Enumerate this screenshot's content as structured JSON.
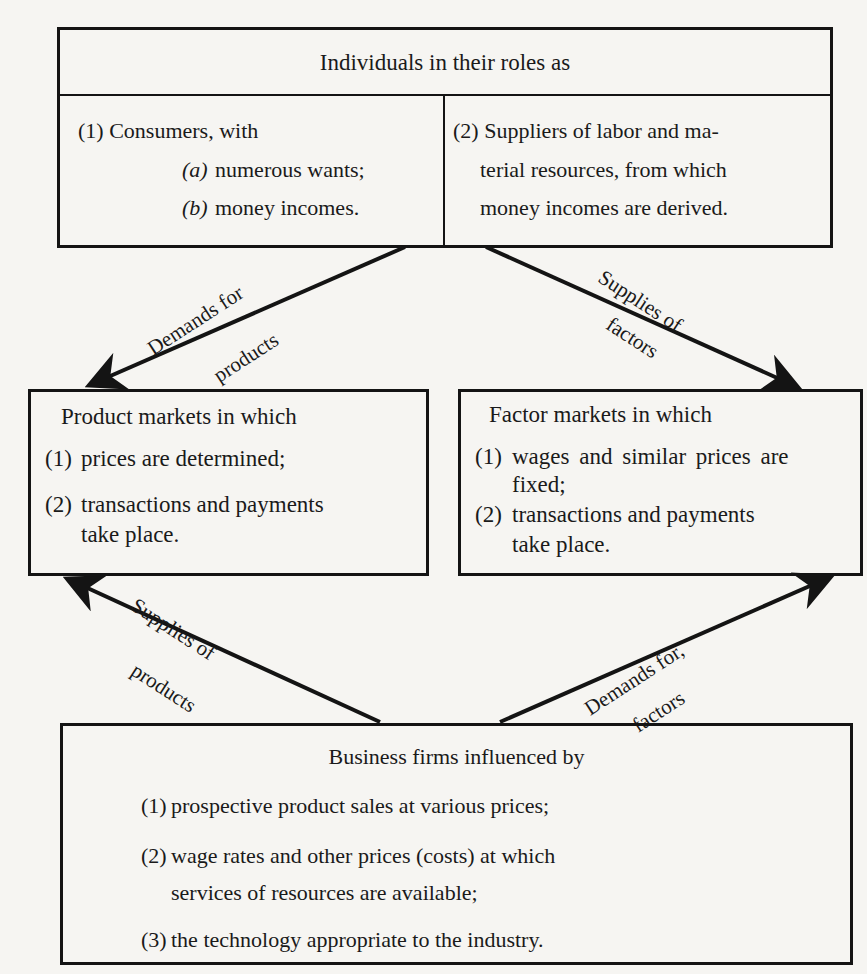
{
  "diagram": {
    "individuals": {
      "title": "Individuals in their roles as",
      "consumers": {
        "line1": "(1) Consumers, with",
        "item_a_marker": "(a)",
        "item_a_text": "numerous wants;",
        "item_b_marker": "(b)",
        "item_b_text": "money incomes."
      },
      "suppliers": {
        "line1": "(2) Suppliers of labor and ma-",
        "line2": "terial resources, from which",
        "line3": "money incomes are derived."
      }
    },
    "product_markets": {
      "title": "Product markets in which",
      "items": [
        {
          "marker": "(1)",
          "lines": [
            "prices are determined;"
          ]
        },
        {
          "marker": "(2)",
          "lines": [
            "transactions and payments",
            "take  place."
          ]
        }
      ]
    },
    "factor_markets": {
      "title": "Factor markets in which",
      "items": [
        {
          "marker": "(1)",
          "lines": [
            "wages and similar prices are",
            "fixed;"
          ]
        },
        {
          "marker": "(2)",
          "lines": [
            "transactions and payments",
            "take  place."
          ]
        }
      ]
    },
    "business_firms": {
      "title": "Business firms  influenced by",
      "items": [
        {
          "marker": "(1)",
          "lines": [
            "prospective product sales at various prices;"
          ]
        },
        {
          "marker": "(2)",
          "lines": [
            "wage rates and other prices (costs) at which",
            "services of resources are available;"
          ]
        },
        {
          "marker": "(3)",
          "lines": [
            "the technology appropriate to the industry."
          ]
        }
      ]
    },
    "arrows": {
      "demands_for_products": {
        "line1": "Demands for",
        "line2": "products"
      },
      "supplies_of_factors": {
        "line1": "Supplies of",
        "line2": "factors"
      },
      "supplies_of_products": {
        "line1": "Supplies of",
        "line2": "products"
      },
      "demands_for_factors": {
        "line1": "Demands for,",
        "line2": "factors"
      }
    }
  }
}
